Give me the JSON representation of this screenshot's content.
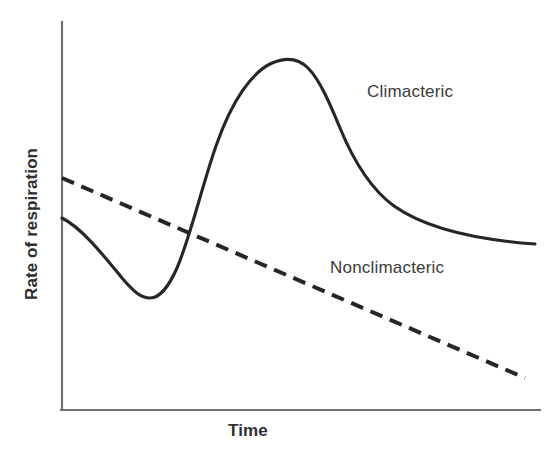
{
  "figure": {
    "background_color": "#ffffff",
    "axis_color": "#6f6f6f",
    "curve_color": "#262626",
    "text_color": "#2f2f2f"
  },
  "axes": {
    "y_title": "Rate of respiration",
    "x_title": "Time"
  },
  "labels": {
    "climacteric": "Climacteric",
    "nonclimacteric": "Nonclimacteric"
  },
  "chart_data": {
    "type": "line",
    "title": "",
    "xlabel": "Time",
    "ylabel": "Rate of respiration",
    "grid": false,
    "legend": "inline-annotations",
    "axis_ticks": [],
    "xlim": [
      0,
      100
    ],
    "ylim": [
      0,
      100
    ],
    "series": [
      {
        "name": "Climacteric",
        "style": "solid",
        "color": "#262626",
        "description": "Respiration falls to a preclimacteric minimum, rises sharply to a climacteric peak, then declines.",
        "x": [
          0,
          6,
          12,
          18,
          24,
          30,
          36,
          42,
          48,
          54,
          60,
          66,
          72,
          78,
          84,
          90,
          96,
          100
        ],
        "y": [
          50,
          43,
          36,
          31,
          29,
          31,
          42,
          62,
          80,
          90,
          90,
          85,
          76,
          67,
          60,
          54,
          48,
          45
        ]
      },
      {
        "name": "Nonclimacteric",
        "style": "dashed",
        "color": "#262626",
        "description": "Respiration declines steadily with no climacteric rise.",
        "x": [
          0,
          100
        ],
        "y": [
          60,
          8
        ]
      }
    ],
    "annotations": [
      {
        "text": "Climacteric",
        "x": 66,
        "y": 78
      },
      {
        "text": "Nonclimacteric",
        "x": 58,
        "y": 36
      }
    ]
  },
  "geometry": {
    "axis": {
      "y_top": 22,
      "y_bottom": 410,
      "x_left": 62,
      "x_right": 540
    },
    "climacteric_path": "M 62,218 C 82,228 104,256 122,278 C 134,292 141,298 150,298 C 160,298 168,288 177,268 C 190,238 202,186 216,146 C 232,100 252,72 272,63 C 286,57 298,58 308,68 C 320,80 330,104 340,128 C 354,162 372,190 394,206 C 428,230 480,240 535,244",
    "nonclimacteric_path": "M 62,178 L 525,378",
    "dash_pattern": "13 8"
  }
}
